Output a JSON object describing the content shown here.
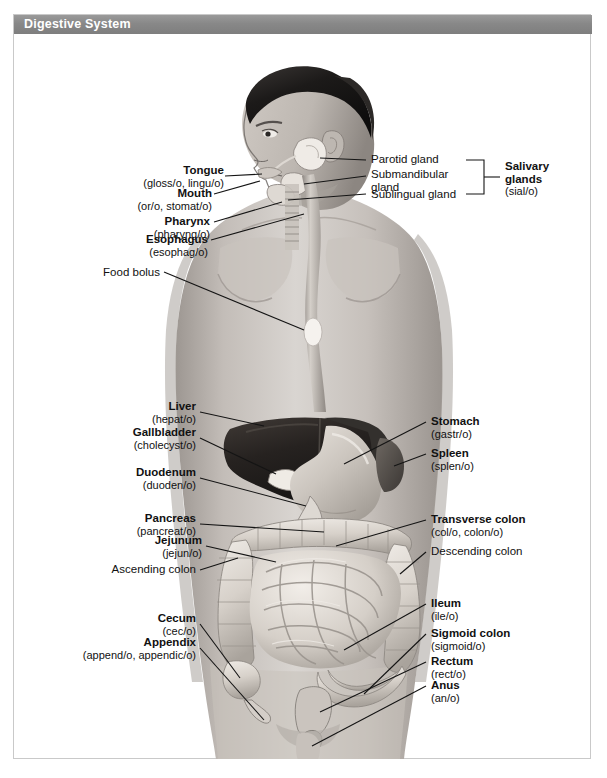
{
  "header": {
    "title": "Digestive System",
    "bar_color": "#888888",
    "text_color": "#ffffff"
  },
  "figure": {
    "alt_name": "male-torso-digestive-anatomy",
    "palette": {
      "skin_light": "#d8d4d0",
      "skin_mid": "#b9b4b0",
      "skin_dark": "#8f8a86",
      "hair": "#1d1b1a",
      "liver": "#2b2826",
      "stomach": "#cfc9c3",
      "intestine": "#e0dbd5",
      "background": "#ffffff"
    }
  },
  "labels_left": [
    {
      "term": "Tongue",
      "root": "(gloss/o, lingu/o)",
      "bold": true
    },
    {
      "term": "Mouth",
      "root": "(or/o, stomat/o)",
      "bold": true
    },
    {
      "term": "Pharynx",
      "root": "(pharyng/o)",
      "bold": true
    },
    {
      "term": "Esophagus",
      "root": "(esophag/o)",
      "bold": true
    },
    {
      "term": "Food bolus",
      "root": "",
      "bold": false
    },
    {
      "term": "Liver",
      "root": "(hepat/o)",
      "bold": true
    },
    {
      "term": "Gallbladder",
      "root": "(cholecyst/o)",
      "bold": true
    },
    {
      "term": "Duodenum",
      "root": "(duoden/o)",
      "bold": true
    },
    {
      "term": "Pancreas",
      "root": "(pancreat/o)",
      "bold": true
    },
    {
      "term": "Jejunum",
      "root": "(jejun/o)",
      "bold": true
    },
    {
      "term": "Ascending colon",
      "root": "",
      "bold": false
    },
    {
      "term": "Cecum",
      "root": "(cec/o)",
      "bold": true
    },
    {
      "term": "Appendix",
      "root": "(append/o, appendic/o)",
      "bold": true
    }
  ],
  "labels_right": [
    {
      "term": "Parotid gland",
      "root": "",
      "bold": false
    },
    {
      "term": "Submandibular",
      "term2": "gland",
      "root": "",
      "bold": false
    },
    {
      "term": "Sublingual gland",
      "root": "",
      "bold": false
    },
    {
      "term": "Salivary",
      "term2": "glands",
      "root": "(sial/o)",
      "bold": true
    },
    {
      "term": "Stomach",
      "root": "(gastr/o)",
      "bold": true
    },
    {
      "term": "Spleen",
      "root": "(splen/o)",
      "bold": true
    },
    {
      "term": "Transverse colon",
      "root": "(col/o, colon/o)",
      "bold": true
    },
    {
      "term": "Descending colon",
      "root": "",
      "bold": false
    },
    {
      "term": "Ileum",
      "root": "(ile/o)",
      "bold": true
    },
    {
      "term": "Sigmoid colon",
      "root": "(sigmoid/o)",
      "bold": true
    },
    {
      "term": "Rectum",
      "root": "(rect/o)",
      "bold": true
    },
    {
      "term": "Anus",
      "root": "(an/o)",
      "bold": true
    }
  ]
}
